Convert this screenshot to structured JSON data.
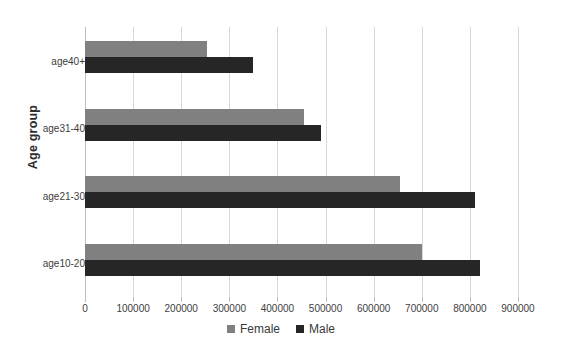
{
  "chart_data": {
    "type": "bar",
    "orientation": "horizontal",
    "title": "",
    "xlabel": "",
    "ylabel": "Age group",
    "categories": [
      "age10-20",
      "age21-30",
      "age31-40",
      "age40+"
    ],
    "series": [
      {
        "name": "Female",
        "color": "#808080",
        "values": [
          700000,
          655000,
          455000,
          253000
        ]
      },
      {
        "name": "Male",
        "color": "#262626",
        "values": [
          820000,
          810000,
          490000,
          350000
        ]
      }
    ],
    "xlim": [
      0,
      900000
    ],
    "xticks": [
      0,
      100000,
      200000,
      300000,
      400000,
      500000,
      600000,
      700000,
      800000,
      900000
    ],
    "xtick_labels": [
      "0",
      "100000",
      "200000",
      "300000",
      "400000",
      "500000",
      "600000",
      "700000",
      "800000",
      "900000"
    ],
    "grid": "vertical",
    "legend_position": "bottom",
    "legend": [
      "Female",
      "Male"
    ]
  }
}
